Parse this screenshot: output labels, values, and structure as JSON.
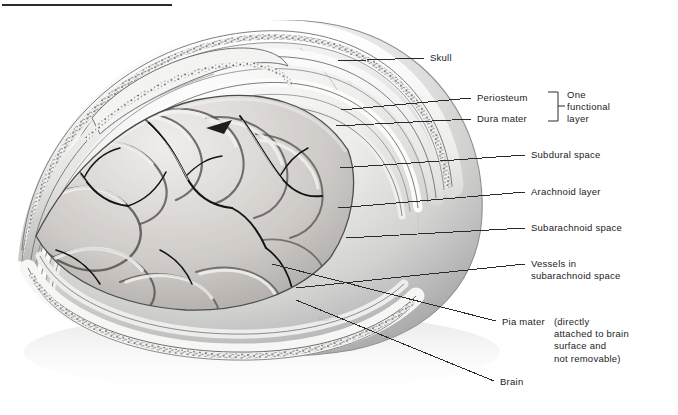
{
  "figure": {
    "title_rule": true,
    "signature": "Nadine"
  },
  "labels": [
    {
      "id": "skull",
      "text": "Skull",
      "x": 430,
      "y": 53,
      "leader": {
        "x1": 338,
        "y1": 61,
        "x2": 424,
        "y2": 58
      }
    },
    {
      "id": "periosteum",
      "text": "Periosteum",
      "x": 477,
      "y": 93,
      "leader": {
        "x1": 341,
        "y1": 110,
        "x2": 471,
        "y2": 98
      }
    },
    {
      "id": "dura-mater",
      "text": "Dura mater",
      "x": 477,
      "y": 114,
      "leader": {
        "x1": 336,
        "y1": 126,
        "x2": 471,
        "y2": 119
      }
    },
    {
      "id": "subdural-space",
      "text": "Subdural space",
      "x": 531,
      "y": 150,
      "leader": {
        "x1": 340,
        "y1": 168,
        "x2": 525,
        "y2": 155
      }
    },
    {
      "id": "arachnoid-layer",
      "text": "Arachnoid layer",
      "x": 531,
      "y": 187,
      "leader": {
        "x1": 338,
        "y1": 208,
        "x2": 525,
        "y2": 192
      }
    },
    {
      "id": "subarachnoid-space",
      "text": "Subarachnoid space",
      "x": 531,
      "y": 223,
      "leader": {
        "x1": 346,
        "y1": 238,
        "x2": 525,
        "y2": 228
      }
    },
    {
      "id": "brain",
      "text": "Brain",
      "x": 500,
      "y": 377,
      "leader": {
        "x1": 296,
        "y1": 300,
        "x2": 494,
        "y2": 382
      }
    }
  ],
  "vessels_label": {
    "id": "vessels-in-subarachnoid-space",
    "line1": "Vessels in",
    "line2": "subarachnoid space",
    "x": 531,
    "y": 259,
    "leader": {
      "x1": 296,
      "y1": 288,
      "x2": 525,
      "y2": 265
    }
  },
  "pia_label": {
    "id": "pia-mater",
    "name": "Pia mater",
    "paren_lines": [
      "(directly",
      "attached to brain",
      "surface and",
      "not removable)"
    ],
    "leader": {
      "x1": 272,
      "y1": 264,
      "x2": 496,
      "y2": 321
    }
  },
  "bracket": {
    "id": "one-functional-layer",
    "lines": [
      "One",
      "functional",
      "layer"
    ],
    "groups": [
      "Periosteum",
      "Dura mater"
    ],
    "x": 548,
    "top": 92,
    "bottom": 121
  },
  "colors": {
    "ink": "#1b1b1b",
    "leader": "#2a2a2a",
    "paper": "#ffffff",
    "skull_light": "#f2f2f1",
    "skull_mid": "#d3d3d2",
    "skull_shadow": "#9fa0a0",
    "brain_light": "#e9e7e6",
    "brain_mid": "#b9b6b4",
    "brain_dark": "#6d6a69",
    "vessel": "#1a1a1a",
    "stipple": "#2e2e2e"
  }
}
